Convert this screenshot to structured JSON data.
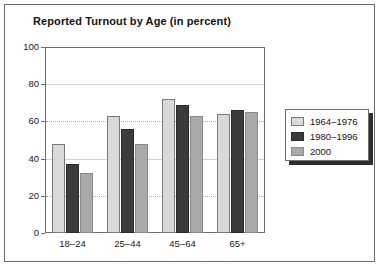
{
  "chart_data": {
    "type": "bar",
    "title": "Reported Turnout by Age (in percent)",
    "xlabel": "",
    "ylabel": "",
    "categories": [
      "18–24",
      "25–44",
      "45–64",
      "65+"
    ],
    "series": [
      {
        "name": "1964–1976",
        "values": [
          48,
          63,
          72,
          64
        ],
        "color": "#d9d9d9"
      },
      {
        "name": "1980–1996",
        "values": [
          37,
          56,
          69,
          66
        ],
        "color": "#3b3b3b"
      },
      {
        "name": "2000",
        "values": [
          32,
          48,
          63,
          65
        ],
        "color": "#a9a9a9"
      }
    ],
    "ylim": [
      0,
      100
    ],
    "yticks": [
      0,
      20,
      40,
      60,
      80,
      100
    ],
    "ytick_labels": [
      "0",
      "20",
      "40",
      "60",
      "80",
      "100"
    ],
    "grid": true,
    "grid_style": {
      "20": "dotted",
      "40": "solid",
      "60": "dotted",
      "80": "solid",
      "100": "solid"
    },
    "legend_position": "right-outside"
  },
  "legend": {
    "items": [
      {
        "label": "1964–1976"
      },
      {
        "label": "1980–1996"
      },
      {
        "label": "2000"
      }
    ]
  }
}
